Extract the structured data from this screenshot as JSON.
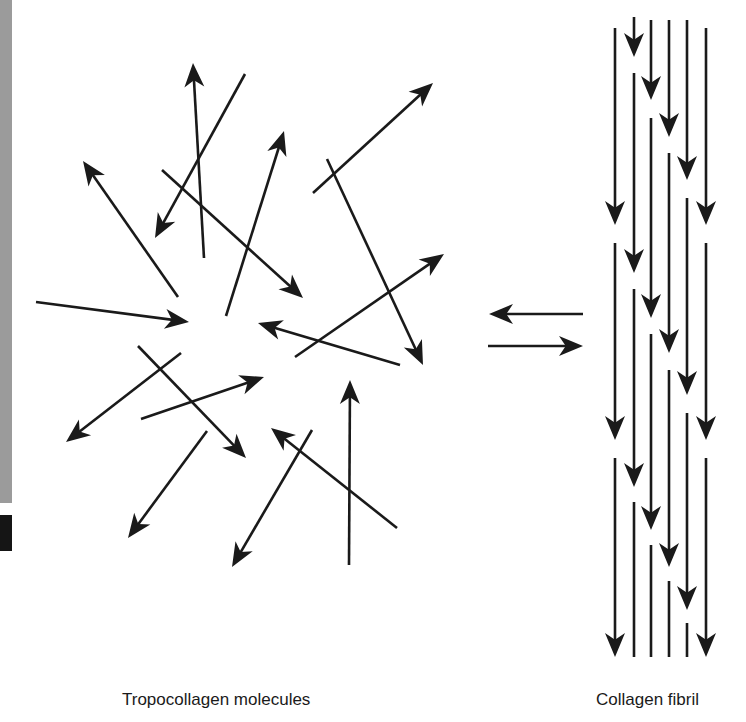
{
  "labels": {
    "left": "Tropocollagen molecules",
    "right": "Collagen fibril"
  },
  "colors": {
    "stroke": "#1a1a1a",
    "edge_strip": "#9b9b9b",
    "edge_block": "#151515"
  },
  "tropocollagen_arrows": [
    {
      "from": [
        204,
        258
      ],
      "to": [
        193,
        63
      ]
    },
    {
      "from": [
        245,
        74
      ],
      "to": [
        155,
        238
      ]
    },
    {
      "from": [
        162,
        170
      ],
      "to": [
        303,
        298
      ]
    },
    {
      "from": [
        226,
        316
      ],
      "to": [
        284,
        131
      ]
    },
    {
      "from": [
        178,
        297
      ],
      "to": [
        83,
        161
      ]
    },
    {
      "from": [
        36,
        302
      ],
      "to": [
        189,
        322
      ]
    },
    {
      "from": [
        313,
        193
      ],
      "to": [
        433,
        83
      ]
    },
    {
      "from": [
        327,
        159
      ],
      "to": [
        423,
        365
      ]
    },
    {
      "from": [
        295,
        357
      ],
      "to": [
        444,
        254
      ]
    },
    {
      "from": [
        400,
        365
      ],
      "to": [
        258,
        323
      ]
    },
    {
      "from": [
        181,
        353
      ],
      "to": [
        66,
        442
      ]
    },
    {
      "from": [
        138,
        346
      ],
      "to": [
        246,
        458
      ]
    },
    {
      "from": [
        141,
        419
      ],
      "to": [
        264,
        377
      ]
    },
    {
      "from": [
        207,
        431
      ],
      "to": [
        128,
        538
      ]
    },
    {
      "from": [
        312,
        430
      ],
      "to": [
        232,
        567
      ]
    },
    {
      "from": [
        397,
        528
      ],
      "to": [
        271,
        428
      ]
    },
    {
      "from": [
        349,
        565
      ],
      "to": [
        350,
        380
      ]
    }
  ],
  "equilibrium_arrows": [
    {
      "from": [
        583,
        314
      ],
      "to": [
        489,
        314
      ]
    },
    {
      "from": [
        488,
        346
      ],
      "to": [
        583,
        346
      ]
    }
  ],
  "fibril_columns": [
    {
      "x": 615,
      "segments": [
        [
          28,
          225,
          true
        ],
        [
          243,
          440,
          true
        ],
        [
          458,
          657,
          true
        ]
      ]
    },
    {
      "x": 634,
      "segments": [
        [
          17,
          57,
          true
        ],
        [
          73,
          273,
          true
        ],
        [
          289,
          487,
          true
        ],
        [
          502,
          657,
          false
        ]
      ]
    },
    {
      "x": 651,
      "segments": [
        [
          20,
          100,
          true
        ],
        [
          118,
          318,
          true
        ],
        [
          334,
          530,
          true
        ],
        [
          545,
          657,
          false
        ]
      ]
    },
    {
      "x": 669,
      "segments": [
        [
          20,
          137,
          true
        ],
        [
          153,
          353,
          true
        ],
        [
          370,
          567,
          true
        ],
        [
          581,
          657,
          false
        ]
      ]
    },
    {
      "x": 687,
      "segments": [
        [
          20,
          180,
          true
        ],
        [
          198,
          395,
          true
        ],
        [
          413,
          610,
          true
        ],
        [
          623,
          657,
          false
        ]
      ]
    },
    {
      "x": 706,
      "segments": [
        [
          28,
          225,
          true
        ],
        [
          243,
          440,
          true
        ],
        [
          458,
          657,
          true
        ]
      ]
    }
  ]
}
